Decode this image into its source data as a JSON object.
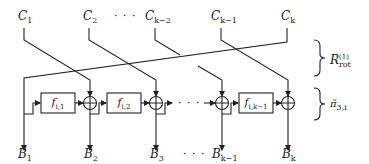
{
  "diagram": {
    "inputs": [
      {
        "label": "C",
        "sub": "1"
      },
      {
        "label": "C",
        "sub": "2"
      },
      {
        "label": "C",
        "sub": "k−2"
      },
      {
        "label": "C",
        "sub": "k−1"
      },
      {
        "label": "C",
        "sub": "k"
      }
    ],
    "outputs": [
      {
        "label": "B",
        "sub": "1"
      },
      {
        "label": "B",
        "sub": "2"
      },
      {
        "label": "B",
        "sub": "3"
      },
      {
        "label": "B",
        "sub": "k−1"
      },
      {
        "label": "B",
        "sub": "k"
      }
    ],
    "functions": [
      {
        "label": "f",
        "sub": "i,1"
      },
      {
        "label": "f",
        "sub": "i,2"
      },
      {
        "label": "f",
        "sub": "i,k−1"
      }
    ],
    "ellipsis": "· · ·",
    "braces": [
      {
        "label": "R",
        "sub": "rot",
        "sup": "(1)"
      },
      {
        "label": "π̃",
        "sub": "3,i"
      }
    ],
    "line_color": "#222222"
  }
}
